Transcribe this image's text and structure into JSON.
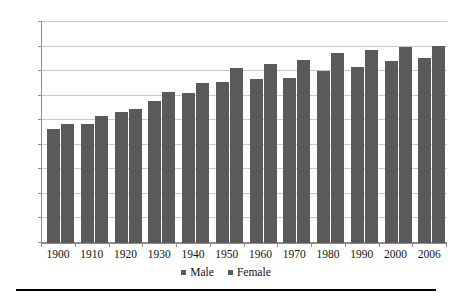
{
  "chart_data": {
    "type": "bar",
    "title": "",
    "subtitle": "",
    "xlabel": "",
    "ylabel": "",
    "ylim": [
      0,
      90
    ],
    "ytick_step": 10,
    "grid": true,
    "legend_position": "bottom-center",
    "categories": [
      "1900",
      "1910",
      "1920",
      "1930",
      "1940",
      "1950",
      "1960",
      "1970",
      "1980",
      "1990",
      "2000",
      "2006"
    ],
    "ytick_labels": [
      "0",
      "10",
      "20",
      "30",
      "40",
      "50",
      "60",
      "70",
      "80",
      "90"
    ],
    "series": [
      {
        "name": "Male",
        "color": "#5a5a5a",
        "values": [
          46.3,
          48.4,
          53.5,
          58.0,
          61.0,
          65.5,
          66.6,
          67.1,
          70.0,
          71.8,
          74.3,
          75.4
        ]
      },
      {
        "name": "Female",
        "color": "#5a5a5a",
        "values": [
          48.3,
          51.8,
          54.6,
          61.6,
          65.2,
          71.1,
          73.1,
          74.7,
          77.4,
          78.8,
          79.7,
          80.2
        ]
      }
    ]
  },
  "legend": {
    "entries": [
      {
        "label": "Male"
      },
      {
        "label": "Female"
      }
    ]
  },
  "colors": {
    "bar": "#5a5a5a",
    "gridline": "#c9c9c9",
    "axis": "#8c8c8c",
    "text": "#111111",
    "footer_rule": "#000000",
    "background": "#ffffff"
  }
}
